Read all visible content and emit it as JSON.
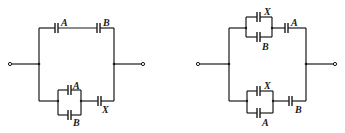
{
  "diagrams": [
    {
      "name": "circuit-left",
      "top_branch": {
        "caps": [
          "A",
          "B"
        ]
      },
      "bottom_branch": {
        "parallel": [
          "A",
          "B"
        ],
        "series": "X"
      }
    },
    {
      "name": "circuit-right",
      "top_branch": {
        "parallel": [
          "X",
          "B"
        ],
        "series": "A"
      },
      "bottom_branch": {
        "parallel": [
          "X",
          "A"
        ],
        "series": "B"
      }
    }
  ],
  "labels": {
    "l_top_a": "A",
    "l_top_b": "B",
    "l_bot_par_a": "A",
    "l_bot_par_b": "B",
    "l_bot_x": "X",
    "r_top_par_x": "X",
    "r_top_par_b": "B",
    "r_top_a": "A",
    "r_bot_par_x": "X",
    "r_bot_par_a": "A",
    "r_bot_b": "B"
  }
}
